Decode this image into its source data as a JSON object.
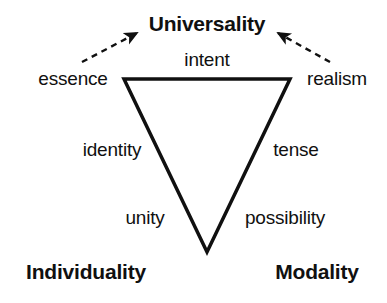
{
  "diagram": {
    "title_visible": false,
    "background_color": "#ffffff",
    "stroke_color": "#101010",
    "text_color": "#101010",
    "shape": "inverted-triangle",
    "vertices": [
      {
        "key": "universality",
        "label": "Universality",
        "x": 207,
        "y": 23,
        "role": "top-apex-label"
      },
      {
        "key": "individuality",
        "label": "Individuality",
        "x": 86,
        "y": 271,
        "role": "bottom-left-label"
      },
      {
        "key": "modality",
        "label": "Modality",
        "x": 317,
        "y": 271,
        "role": "bottom-right-label"
      }
    ],
    "edge_labels": [
      {
        "key": "intent",
        "label": "intent",
        "x": 207,
        "y": 59,
        "edge": "top"
      },
      {
        "key": "essence",
        "label": "essence",
        "x": 73,
        "y": 78,
        "edge": "upper-left-outside"
      },
      {
        "key": "realism",
        "label": "realism",
        "x": 337,
        "y": 78,
        "edge": "upper-right-outside"
      },
      {
        "key": "identity",
        "label": "identity",
        "x": 112,
        "y": 149,
        "edge": "left-upper"
      },
      {
        "key": "tense",
        "label": "tense",
        "x": 296,
        "y": 149,
        "edge": "right-upper"
      },
      {
        "key": "unity",
        "label": "unity",
        "x": 145,
        "y": 217,
        "edge": "left-lower"
      },
      {
        "key": "possibility",
        "label": "possibility",
        "x": 285,
        "y": 217,
        "edge": "right-lower"
      }
    ],
    "triangle": {
      "points": "124,79 290,79 207,252",
      "stroke_width": 3.5,
      "fill": "none"
    },
    "arrows": [
      {
        "key": "arrow-essence-to-universality",
        "style": "dashed",
        "from_x": 82,
        "from_y": 62,
        "to_x": 137,
        "to_y": 33,
        "head": "solid-triangle"
      },
      {
        "key": "arrow-realism-to-universality",
        "style": "dashed",
        "from_x": 330,
        "from_y": 62,
        "to_x": 278,
        "to_y": 33,
        "head": "solid-triangle"
      }
    ]
  }
}
